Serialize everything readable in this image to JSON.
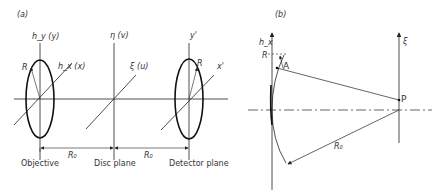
{
  "panel_a": {
    "tag": "(a)",
    "axes": {
      "objective_vertical": "h_y (y)",
      "objective_diag": "h_x (x)",
      "disc_vertical": "η (v)",
      "disc_diag": "ξ (u)",
      "detector_vertical": "y'",
      "detector_diag": "x'"
    },
    "radius_label": "R",
    "distance_label": "R₀",
    "planes": [
      "Objective",
      "Disc plane",
      "Detector plane"
    ]
  },
  "panel_b": {
    "tag": "(b)",
    "axis_left": "h_x",
    "axis_right": "ξ",
    "radius_label": "R",
    "point_a": "A",
    "point_p": "P",
    "distance_label": "R₀"
  },
  "colors": {
    "line": "#222222",
    "text": "#333333"
  }
}
